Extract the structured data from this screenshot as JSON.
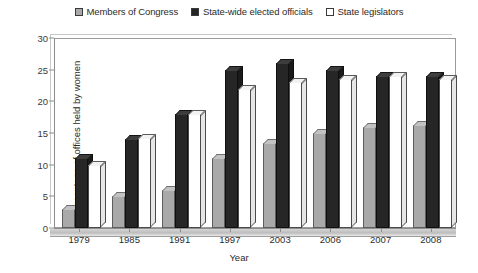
{
  "chart_data": {
    "type": "bar",
    "title": "",
    "xlabel": "Year",
    "ylabel": "Percentage of offices held by women",
    "ylim": [
      0,
      30
    ],
    "yticks": [
      0,
      5,
      10,
      15,
      20,
      25,
      30
    ],
    "grid": false,
    "legend_position": "top-center",
    "categories": [
      "1979",
      "1985",
      "1991",
      "1997",
      "2003",
      "2006",
      "2007",
      "2008"
    ],
    "series": [
      {
        "name": "Members of Congress",
        "color": "#a9a9a9",
        "values": [
          3,
          5,
          6,
          11,
          13.5,
          15,
          16,
          16.3
        ]
      },
      {
        "name": "State-wide elected officials",
        "color": "#262626",
        "values": [
          11,
          14,
          18,
          25,
          26,
          25,
          24,
          24
        ]
      },
      {
        "name": "State legislators",
        "color": "#ffffff",
        "values": [
          10,
          14.2,
          18,
          22,
          23,
          23.5,
          24,
          23.5
        ]
      }
    ]
  },
  "legend": {
    "items": [
      {
        "label": "Members of Congress",
        "swatch": "gray-swatch-icon"
      },
      {
        "label": "State-wide elected officials",
        "swatch": "black-swatch-icon"
      },
      {
        "label": "State legislators",
        "swatch": "white-swatch-icon"
      }
    ]
  }
}
